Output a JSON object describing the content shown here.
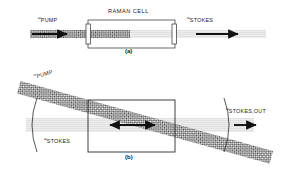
{
  "figure": {
    "captions": [
      {
        "id": "caption-a",
        "text": "(a)"
      },
      {
        "id": "caption-b",
        "text": "(b)"
      }
    ]
  },
  "panel_a": {
    "caption": "(a)",
    "cell_label": "RAMAN CELL",
    "labels": {
      "pump_symbol": "ω",
      "pump_text": "PUMP",
      "stokes_symbol": "ω",
      "stokes_text": "STOKES"
    },
    "elements": {
      "pump_beam": "hatched-pump-beam",
      "stokes_beam": "light-stokes-beam",
      "entrance_window": "cell-entrance-window",
      "exit_window": "cell-exit-window",
      "pump_arrow": "pump-direction-arrow",
      "stokes_arrow": "stokes-direction-arrow"
    }
  },
  "panel_b": {
    "caption": "(b)",
    "labels": {
      "pump_symbol": "ω",
      "pump_text": "PUMP",
      "stokes_symbol": "ω",
      "stokes_text": "STOKES",
      "stokes_out_symbol": "ω",
      "stokes_out_text": "STOKES,OUT"
    },
    "elements": {
      "pump_beam": "diagonal-pump-beam",
      "stokes_beam": "horizontal-stokes-beam",
      "cell_box": "raman-cell-box",
      "left_mirror": "left-curved-mirror",
      "right_mirror": "right-curved-mirror",
      "resonator_arrow": "bidirectional-resonator-arrow",
      "output_arrow": "stokes-output-arrow"
    }
  },
  "colors": {
    "ink": "#1a1a1a",
    "line": "#2b2b2b",
    "beam_hatch": "#3a3a3a",
    "stokes_fill": "#e2e2e2",
    "background": "#ffffff"
  }
}
